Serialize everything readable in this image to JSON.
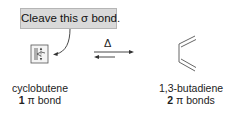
{
  "callout": {
    "text": "Cleave this σ bond."
  },
  "reaction": {
    "condition": "Δ",
    "arrow": "equilibrium"
  },
  "reactant": {
    "name": "cyclobutene",
    "count": "1",
    "pi_label": "π bond"
  },
  "product": {
    "name": "1,3-butadiene",
    "count": "2",
    "pi_label": "π bonds"
  },
  "colors": {
    "callout_bg": "#d9d9d9",
    "line": "#444444"
  }
}
